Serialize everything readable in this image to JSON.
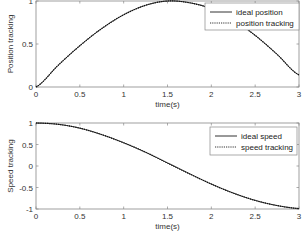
{
  "chart_data": [
    {
      "type": "line",
      "title": "",
      "xlabel": "time(s)",
      "ylabel": "Position tracking",
      "xlim": [
        0,
        3
      ],
      "ylim": [
        0,
        1
      ],
      "xticks": [
        "0",
        "0.5",
        "1",
        "1.5",
        "2",
        "2.5",
        "3"
      ],
      "yticks": [
        "0",
        "0.5",
        "1"
      ],
      "grid": false,
      "legend_position": "upper right",
      "x": [
        0,
        0.25,
        0.5,
        0.75,
        1.0,
        1.25,
        1.5,
        1.75,
        2.0,
        2.25,
        2.5,
        2.75,
        3.0
      ],
      "series": [
        {
          "name": "ideal position",
          "style": "solid",
          "values": [
            0,
            0.25,
            0.48,
            0.68,
            0.84,
            0.95,
            1.0,
            0.98,
            0.91,
            0.78,
            0.6,
            0.38,
            0.14
          ]
        },
        {
          "name": "position tracking",
          "style": "dotted",
          "values": [
            0,
            0.25,
            0.48,
            0.68,
            0.84,
            0.95,
            1.0,
            0.98,
            0.91,
            0.78,
            0.6,
            0.38,
            0.14
          ]
        }
      ]
    },
    {
      "type": "line",
      "title": "",
      "xlabel": "time(s)",
      "ylabel": "Speed tracking",
      "xlim": [
        0,
        3
      ],
      "ylim": [
        -1,
        1
      ],
      "xticks": [
        "0",
        "0.5",
        "1",
        "1.5",
        "2",
        "2.5",
        "3"
      ],
      "yticks": [
        "-1",
        "-0.5",
        "0",
        "0.5",
        "1"
      ],
      "grid": false,
      "legend_position": "upper right",
      "x": [
        0,
        0.25,
        0.5,
        0.75,
        1.0,
        1.25,
        1.5,
        1.75,
        2.0,
        2.25,
        2.5,
        2.75,
        3.0
      ],
      "series": [
        {
          "name": "ideal speed",
          "style": "solid",
          "values": [
            1.0,
            0.97,
            0.88,
            0.73,
            0.54,
            0.32,
            0.07,
            -0.18,
            -0.42,
            -0.63,
            -0.8,
            -0.92,
            -0.99
          ]
        },
        {
          "name": "speed tracking",
          "style": "dotted",
          "values": [
            1.0,
            0.97,
            0.88,
            0.73,
            0.54,
            0.32,
            0.07,
            -0.18,
            -0.42,
            -0.63,
            -0.8,
            -0.92,
            -0.99
          ]
        }
      ]
    }
  ]
}
